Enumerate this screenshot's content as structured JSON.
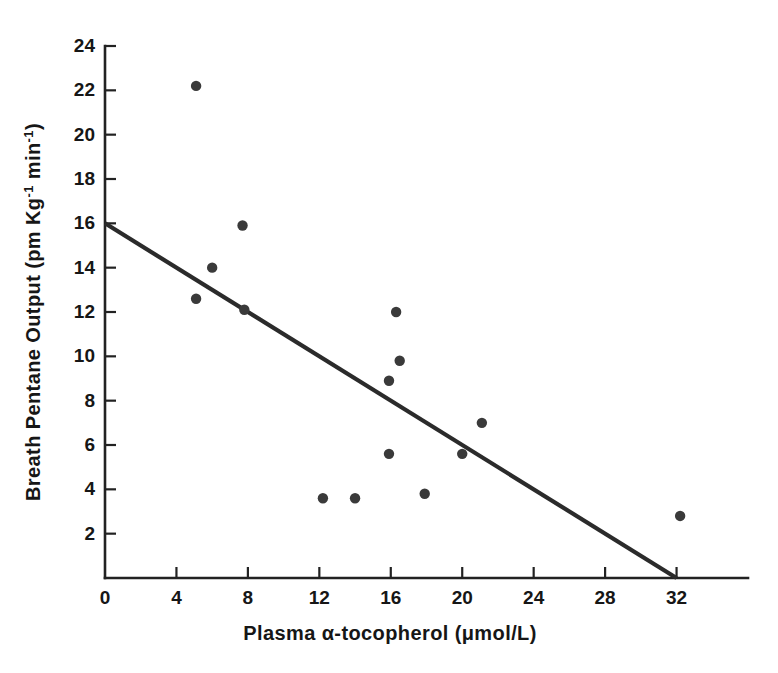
{
  "chart_data": {
    "type": "scatter",
    "title": "",
    "xlabel": "Plasma α-tocopherol (μmol/L)",
    "ylabel": "Breath Pentane Output (pm Kg⁻¹ min⁻¹)",
    "ylabel_parts": {
      "base": "Breath Pentane Output (pm Kg",
      "sup1": "-1",
      "mid": " min",
      "sup2": "-1",
      "close": ")"
    },
    "xlabel_parts": {
      "lead": "Plasma ",
      "alpha": "α",
      "rest": "-tocopherol (μmol/L)"
    },
    "xlim": [
      0,
      36
    ],
    "ylim": [
      0,
      24
    ],
    "xticks": [
      0,
      4,
      8,
      12,
      16,
      20,
      24,
      28,
      32
    ],
    "yticks": [
      2,
      4,
      6,
      8,
      10,
      12,
      14,
      16,
      18,
      20,
      22,
      24
    ],
    "xtick_labels": [
      "0",
      "4",
      "8",
      "12",
      "16",
      "20",
      "24",
      "28",
      "32"
    ],
    "ytick_labels": [
      "2",
      "4",
      "6",
      "8",
      "10",
      "12",
      "14",
      "16",
      "18",
      "20",
      "22",
      "24"
    ],
    "grid": false,
    "legend": false,
    "legend_position": "none",
    "marker": "filled-circle",
    "marker_color": "#3a3a3a",
    "marker_radius": 5.2,
    "line_color": "#2b2b2b",
    "axis_color": "#222222",
    "background_color": "#ffffff",
    "points": [
      {
        "x": 5.1,
        "y": 22.2
      },
      {
        "x": 7.7,
        "y": 15.9
      },
      {
        "x": 6.0,
        "y": 14.0
      },
      {
        "x": 5.1,
        "y": 12.6
      },
      {
        "x": 7.8,
        "y": 12.1
      },
      {
        "x": 16.3,
        "y": 12.0
      },
      {
        "x": 16.5,
        "y": 9.8
      },
      {
        "x": 15.9,
        "y": 8.9
      },
      {
        "x": 21.1,
        "y": 7.0
      },
      {
        "x": 15.9,
        "y": 5.6
      },
      {
        "x": 20.0,
        "y": 5.6
      },
      {
        "x": 17.9,
        "y": 3.8
      },
      {
        "x": 12.2,
        "y": 3.6
      },
      {
        "x": 14.0,
        "y": 3.6
      },
      {
        "x": 32.2,
        "y": 2.8
      }
    ],
    "regression_line": {
      "x_start": 0,
      "y_start": 16.0,
      "x_end": 32.0,
      "y_end": 0.0,
      "slope": -0.5,
      "intercept": 16.0
    }
  }
}
